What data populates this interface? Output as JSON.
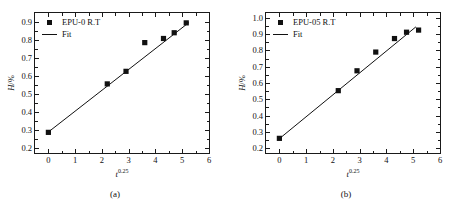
{
  "figure": {
    "panels": [
      {
        "id": "a",
        "caption": "(a)",
        "legend": [
          {
            "key": "square-marker",
            "label": "EPU-0  R.T"
          },
          {
            "key": "line",
            "label": "Fit"
          }
        ],
        "chart_data": {
          "type": "scatter",
          "title": "",
          "xlabel": "t",
          "xlabel_exponent": "0.25",
          "ylabel": "H",
          "ylabel_unit": "/%",
          "xlim": [
            -0.5,
            6
          ],
          "ylim": [
            0.17,
            0.95
          ],
          "xticks": [
            "0",
            "1",
            "2",
            "3",
            "4",
            "5",
            "6"
          ],
          "xtick_values": [
            0,
            1,
            2,
            3,
            4,
            5,
            6
          ],
          "yticks": [
            "0.2",
            "0.3",
            "0.4",
            "0.5",
            "0.6",
            "0.7",
            "0.8",
            "0.9"
          ],
          "ytick_values": [
            0.2,
            0.3,
            0.4,
            0.5,
            0.6,
            0.7,
            0.8,
            0.9
          ],
          "grid": false,
          "legend_position": "upper-left",
          "series": [
            {
              "name": "EPU-0  R.T",
              "marker": "square",
              "color": "#111111",
              "x": [
                0.0,
                2.2,
                2.9,
                3.6,
                4.3,
                4.7,
                5.15
              ],
              "y": [
                0.285,
                0.555,
                0.625,
                0.785,
                0.808,
                0.84,
                0.895
              ]
            },
            {
              "name": "Fit",
              "marker": "none",
              "color": "#111111",
              "x": [
                0.0,
                5.25
              ],
              "y": [
                0.287,
                0.897
              ]
            }
          ]
        }
      },
      {
        "id": "b",
        "caption": "(b)",
        "legend": [
          {
            "key": "square-marker",
            "label": "EPU-05  R.T"
          },
          {
            "key": "line",
            "label": "Fit"
          }
        ],
        "chart_data": {
          "type": "scatter",
          "title": "",
          "xlabel": "t",
          "xlabel_exponent": "0.25",
          "ylabel": "H",
          "ylabel_unit": "/%",
          "xlim": [
            -0.5,
            6
          ],
          "ylim": [
            0.17,
            1.03
          ],
          "xticks": [
            "0",
            "1",
            "2",
            "3",
            "4",
            "5",
            "6"
          ],
          "xtick_values": [
            0,
            1,
            2,
            3,
            4,
            5,
            6
          ],
          "yticks": [
            "0.2",
            "0.3",
            "0.4",
            "0.5",
            "0.6",
            "0.7",
            "0.8",
            "0.9",
            "1.0"
          ],
          "ytick_values": [
            0.2,
            0.3,
            0.4,
            0.5,
            0.6,
            0.7,
            0.8,
            0.9,
            1.0
          ],
          "grid": false,
          "legend_position": "upper-left",
          "series": [
            {
              "name": "EPU-05  R.T",
              "marker": "square",
              "color": "#111111",
              "x": [
                0.0,
                2.2,
                2.9,
                3.6,
                4.3,
                4.75,
                5.2
              ],
              "y": [
                0.26,
                0.553,
                0.675,
                0.79,
                0.873,
                0.912,
                0.925
              ]
            },
            {
              "name": "Fit",
              "marker": "none",
              "color": "#111111",
              "x": [
                0.0,
                5.1
              ],
              "y": [
                0.258,
                0.945
              ]
            }
          ]
        }
      }
    ]
  }
}
